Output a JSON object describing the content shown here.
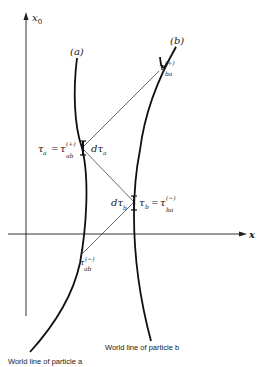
{
  "diagram": {
    "axes": {
      "vertical_label": "x",
      "vertical_sub": "0",
      "horizontal_label": "x"
    },
    "curves": {
      "a_label": "(a)",
      "b_label": "(b)"
    },
    "points": {
      "tau_a": "τ",
      "tau_a_sub": "a",
      "eq": "=",
      "tau_ab_plus": "τ",
      "tau_ab_plus_sup": "(+)",
      "tau_ab_plus_sub": "ab",
      "dtau_a": "dτ",
      "dtau_a_sub": "a",
      "tau_ba_plus": "τ",
      "tau_ba_plus_sup": "(+)",
      "tau_ba_plus_sub": "ba",
      "dtau_b": "dτ",
      "dtau_b_sub": "b",
      "tau_b": "τ",
      "tau_b_sub": "b",
      "tau_ba_minus": "τ",
      "tau_ba_minus_sup": "(−)",
      "tau_ba_minus_sub": "ba",
      "tau_ab_minus": "τ",
      "tau_ab_minus_sup": "(−)",
      "tau_ab_minus_sub": "ab"
    },
    "captions": {
      "particle_b": "World line of particle b",
      "particle_a": "World line of particle a"
    }
  }
}
